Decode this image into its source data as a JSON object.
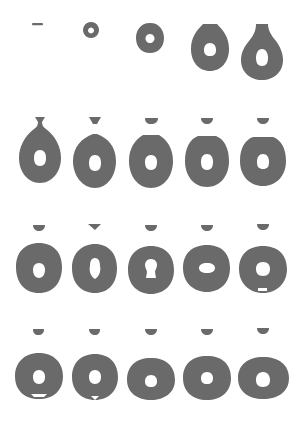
{
  "figure": {
    "description": "Sequence of 20 frames showing drop growth, pinch-off and oscillation of a hollow (ring-section) drop",
    "rows": 4,
    "cols": 5,
    "fill_color": "#6a6a6a",
    "background_color": "#ffffff",
    "hole_color": "#ffffff"
  },
  "frames": [
    {
      "row": 1,
      "col": 1,
      "stage": "initial-film"
    },
    {
      "row": 1,
      "col": 2,
      "stage": "small-ring"
    },
    {
      "row": 1,
      "col": 3,
      "stage": "growing-ring"
    },
    {
      "row": 1,
      "col": 4,
      "stage": "pendant-drop"
    },
    {
      "row": 1,
      "col": 5,
      "stage": "necking-drop"
    },
    {
      "row": 2,
      "col": 1,
      "stage": "pinch-off"
    },
    {
      "row": 2,
      "col": 2,
      "stage": "detached-with-cap"
    },
    {
      "row": 2,
      "col": 3,
      "stage": "oscillation"
    },
    {
      "row": 2,
      "col": 4,
      "stage": "oscillation"
    },
    {
      "row": 2,
      "col": 5,
      "stage": "oscillation"
    },
    {
      "row": 3,
      "col": 1,
      "stage": "oscillation"
    },
    {
      "row": 3,
      "col": 2,
      "stage": "hole-deformation"
    },
    {
      "row": 3,
      "col": 3,
      "stage": "keyhole-hole"
    },
    {
      "row": 3,
      "col": 4,
      "stage": "oblate-hole"
    },
    {
      "row": 3,
      "col": 5,
      "stage": "oscillation"
    },
    {
      "row": 4,
      "col": 1,
      "stage": "oscillation"
    },
    {
      "row": 4,
      "col": 2,
      "stage": "oscillation"
    },
    {
      "row": 4,
      "col": 3,
      "stage": "oscillation"
    },
    {
      "row": 4,
      "col": 4,
      "stage": "oscillation"
    },
    {
      "row": 4,
      "col": 5,
      "stage": "relaxed-ring"
    }
  ]
}
